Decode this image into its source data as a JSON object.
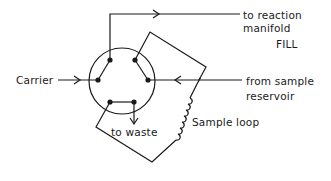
{
  "diagram": {
    "type": "six-port injection valve schematic",
    "mode_label": "FILL",
    "labels": {
      "carrier": "Carrier",
      "to_reaction_line1": "to reaction",
      "to_reaction_line2": "manifold",
      "from_sample_line1": "from sample",
      "from_sample_line2": "reservoir",
      "to_waste": "to waste",
      "sample_loop": "Sample loop"
    },
    "ports": 6,
    "colors": {
      "line": "#1a1a1a",
      "background": "#ffffff"
    },
    "connections": [
      {
        "from": "Carrier",
        "to": "to reaction manifold"
      },
      {
        "from": "from sample reservoir",
        "to": "Sample loop"
      },
      {
        "from": "Sample loop",
        "to": "to waste"
      }
    ]
  }
}
